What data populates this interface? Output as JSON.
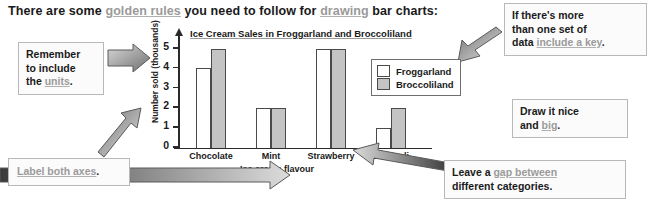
{
  "headline": {
    "part1": "There are some ",
    "link1": "golden rules",
    "part2": " you need to follow for ",
    "link2": "drawing",
    "part3": " bar charts:"
  },
  "chart_data": {
    "type": "bar",
    "title": "Ice Cream Sales in Froggarland and Broccoliland",
    "xlabel": "Ice cream flavour",
    "ylabel": "Number sold (thousands)",
    "categories": [
      "Chocolate",
      "Mint",
      "Strawberry",
      "Broccoli"
    ],
    "series": [
      {
        "name": "Froggarland",
        "values": [
          4,
          2,
          5,
          1
        ],
        "color": "#ffffff"
      },
      {
        "name": "Broccoliland",
        "values": [
          5,
          2,
          5,
          2
        ],
        "color": "#c4c4c4"
      }
    ],
    "ylim": [
      0,
      5
    ],
    "yticks": [
      0,
      1,
      2,
      3,
      4,
      5
    ],
    "grid": false,
    "legend_position": "inside-top-right"
  },
  "callouts": {
    "units": {
      "line1": "Remember",
      "line2": "to include",
      "line3_pre": "the ",
      "line3_link": "units",
      "line3_post": "."
    },
    "label_axes": {
      "link": "Label both axes",
      "post": "."
    },
    "key": {
      "line1": "If there's more",
      "line2": "than one set of",
      "line3_pre": "data ",
      "line3_link": "include a key",
      "line3_post": "."
    },
    "big": {
      "line1": "Draw it nice",
      "line2_pre": "and ",
      "line2_link": "big",
      "line2_post": "."
    },
    "gap": {
      "line1_pre": "Leave a ",
      "line1_link": "gap between",
      "line2": "different categories."
    }
  }
}
